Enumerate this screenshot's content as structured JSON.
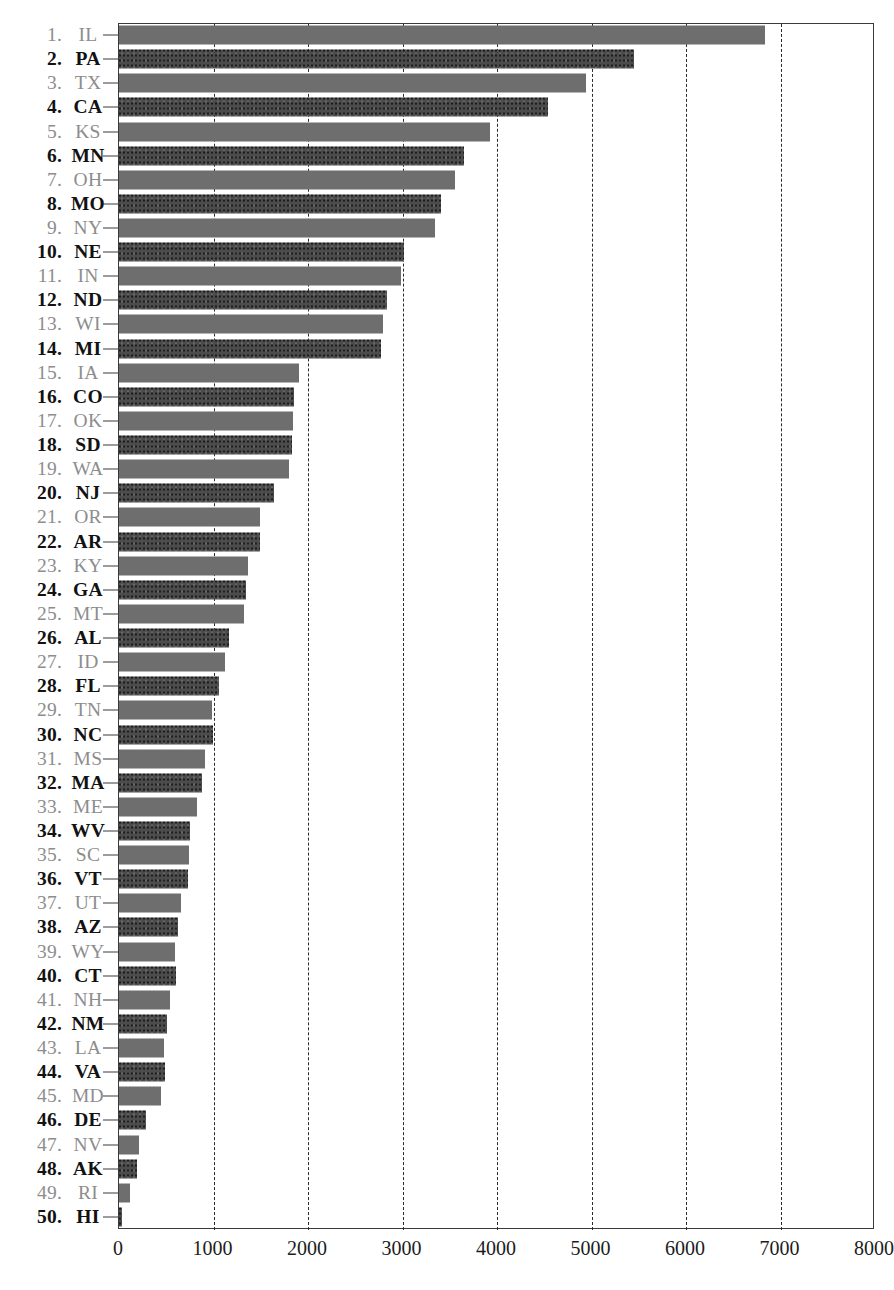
{
  "chart_data": {
    "type": "bar",
    "orientation": "horizontal",
    "title": "",
    "xlabel": "",
    "ylabel": "",
    "xlim": [
      0,
      8000
    ],
    "xticks": [
      0,
      1000,
      2000,
      3000,
      4000,
      5000,
      6000,
      7000,
      8000
    ],
    "xtick_labels": [
      "0",
      "1000",
      "2000",
      "3000",
      "4000",
      "5000",
      "6000",
      "7000",
      "8000"
    ],
    "grid": "vertical-dashed",
    "legend": "none",
    "sorted": "descending",
    "categories": [
      "IL",
      "PA",
      "TX",
      "CA",
      "KS",
      "MN",
      "OH",
      "MO",
      "NY",
      "NE",
      "IN",
      "ND",
      "WI",
      "MI",
      "IA",
      "CO",
      "OK",
      "SD",
      "WA",
      "NJ",
      "OR",
      "AR",
      "KY",
      "GA",
      "MT",
      "AL",
      "ID",
      "FL",
      "TN",
      "NC",
      "MS",
      "MA",
      "ME",
      "WV",
      "SC",
      "VT",
      "UT",
      "AZ",
      "WY",
      "CT",
      "NH",
      "NM",
      "LA",
      "VA",
      "MD",
      "DE",
      "NV",
      "AK",
      "RI",
      "HI"
    ],
    "values": [
      6840,
      5450,
      4940,
      4540,
      3930,
      3650,
      3560,
      3410,
      3340,
      3020,
      2980,
      2840,
      2790,
      2770,
      1910,
      1850,
      1840,
      1830,
      1800,
      1640,
      1490,
      1490,
      1370,
      1340,
      1320,
      1160,
      1120,
      1060,
      980,
      990,
      910,
      880,
      830,
      750,
      740,
      730,
      660,
      620,
      590,
      600,
      540,
      510,
      480,
      490,
      440,
      290,
      210,
      190,
      120,
      30
    ],
    "rows": [
      {
        "rank": "1.",
        "state": "IL",
        "value": 6840,
        "shade": "light"
      },
      {
        "rank": "2.",
        "state": "PA",
        "value": 5450,
        "shade": "dark"
      },
      {
        "rank": "3.",
        "state": "TX",
        "value": 4940,
        "shade": "light"
      },
      {
        "rank": "4.",
        "state": "CA",
        "value": 4540,
        "shade": "dark"
      },
      {
        "rank": "5.",
        "state": "KS",
        "value": 3930,
        "shade": "light"
      },
      {
        "rank": "6.",
        "state": "MN",
        "value": 3650,
        "shade": "dark"
      },
      {
        "rank": "7.",
        "state": "OH",
        "value": 3560,
        "shade": "light"
      },
      {
        "rank": "8.",
        "state": "MO",
        "value": 3410,
        "shade": "dark"
      },
      {
        "rank": "9.",
        "state": "NY",
        "value": 3340,
        "shade": "light"
      },
      {
        "rank": "10.",
        "state": "NE",
        "value": 3020,
        "shade": "dark"
      },
      {
        "rank": "11.",
        "state": "IN",
        "value": 2980,
        "shade": "light"
      },
      {
        "rank": "12.",
        "state": "ND",
        "value": 2840,
        "shade": "dark"
      },
      {
        "rank": "13.",
        "state": "WI",
        "value": 2790,
        "shade": "light"
      },
      {
        "rank": "14.",
        "state": "MI",
        "value": 2770,
        "shade": "dark"
      },
      {
        "rank": "15.",
        "state": "IA",
        "value": 1910,
        "shade": "light"
      },
      {
        "rank": "16.",
        "state": "CO",
        "value": 1850,
        "shade": "dark"
      },
      {
        "rank": "17.",
        "state": "OK",
        "value": 1840,
        "shade": "light"
      },
      {
        "rank": "18.",
        "state": "SD",
        "value": 1830,
        "shade": "dark"
      },
      {
        "rank": "19.",
        "state": "WA",
        "value": 1800,
        "shade": "light"
      },
      {
        "rank": "20.",
        "state": "NJ",
        "value": 1640,
        "shade": "dark"
      },
      {
        "rank": "21.",
        "state": "OR",
        "value": 1490,
        "shade": "light"
      },
      {
        "rank": "22.",
        "state": "AR",
        "value": 1490,
        "shade": "dark"
      },
      {
        "rank": "23.",
        "state": "KY",
        "value": 1370,
        "shade": "light"
      },
      {
        "rank": "24.",
        "state": "GA",
        "value": 1340,
        "shade": "dark"
      },
      {
        "rank": "25.",
        "state": "MT",
        "value": 1320,
        "shade": "light"
      },
      {
        "rank": "26.",
        "state": "AL",
        "value": 1160,
        "shade": "dark"
      },
      {
        "rank": "27.",
        "state": "ID",
        "value": 1120,
        "shade": "light"
      },
      {
        "rank": "28.",
        "state": "FL",
        "value": 1060,
        "shade": "dark"
      },
      {
        "rank": "29.",
        "state": "TN",
        "value": 980,
        "shade": "light"
      },
      {
        "rank": "30.",
        "state": "NC",
        "value": 990,
        "shade": "dark"
      },
      {
        "rank": "31.",
        "state": "MS",
        "value": 910,
        "shade": "light"
      },
      {
        "rank": "32.",
        "state": "MA",
        "value": 880,
        "shade": "dark"
      },
      {
        "rank": "33.",
        "state": "ME",
        "value": 830,
        "shade": "light"
      },
      {
        "rank": "34.",
        "state": "WV",
        "value": 750,
        "shade": "dark"
      },
      {
        "rank": "35.",
        "state": "SC",
        "value": 740,
        "shade": "light"
      },
      {
        "rank": "36.",
        "state": "VT",
        "value": 730,
        "shade": "dark"
      },
      {
        "rank": "37.",
        "state": "UT",
        "value": 660,
        "shade": "light"
      },
      {
        "rank": "38.",
        "state": "AZ",
        "value": 620,
        "shade": "dark"
      },
      {
        "rank": "39.",
        "state": "WY",
        "value": 590,
        "shade": "light"
      },
      {
        "rank": "40.",
        "state": "CT",
        "value": 600,
        "shade": "dark"
      },
      {
        "rank": "41.",
        "state": "NH",
        "value": 540,
        "shade": "light"
      },
      {
        "rank": "42.",
        "state": "NM",
        "value": 510,
        "shade": "dark"
      },
      {
        "rank": "43.",
        "state": "LA",
        "value": 480,
        "shade": "light"
      },
      {
        "rank": "44.",
        "state": "VA",
        "value": 490,
        "shade": "dark"
      },
      {
        "rank": "45.",
        "state": "MD",
        "value": 440,
        "shade": "light"
      },
      {
        "rank": "46.",
        "state": "DE",
        "value": 290,
        "shade": "dark"
      },
      {
        "rank": "47.",
        "state": "NV",
        "value": 210,
        "shade": "light"
      },
      {
        "rank": "48.",
        "state": "AK",
        "value": 190,
        "shade": "dark"
      },
      {
        "rank": "49.",
        "state": "RI",
        "value": 120,
        "shade": "light"
      },
      {
        "rank": "50.",
        "state": "HI",
        "value": 30,
        "shade": "dark"
      }
    ]
  },
  "geometry": {
    "plot_left_px": 118,
    "plot_right_px": 874,
    "plot_top_px": 23,
    "plot_bottom_px": 1229,
    "px_per_1000": 94.5,
    "row_pitch_px": 24.12,
    "bar_height_px": 19
  },
  "colors": {
    "bar_dark": "#4c4c4c",
    "bar_light": "#6e6e6e",
    "text_dark": "#121212",
    "text_light": "#8d8d8d",
    "axis": "#3a3a3a",
    "gridline": "#2b2b2b",
    "background": "#ffffff"
  }
}
